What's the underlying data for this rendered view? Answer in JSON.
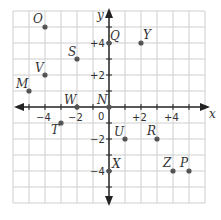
{
  "plane": {
    "x_axis_label": "x",
    "y_axis_label": "y",
    "origin_label": "0",
    "range": {
      "xmin": -6,
      "xmax": 6,
      "ymin": -6,
      "ymax": 6
    },
    "x_ticks": [
      {
        "value": -4,
        "label": "−4"
      },
      {
        "value": -2,
        "label": "−2"
      },
      {
        "value": 2,
        "label": "+2"
      },
      {
        "value": 4,
        "label": "+4"
      }
    ],
    "y_ticks": [
      {
        "value": 4,
        "label": "+4"
      },
      {
        "value": 2,
        "label": "+2"
      },
      {
        "value": -2,
        "label": "−2"
      },
      {
        "value": -4,
        "label": "−4"
      }
    ],
    "colors": {
      "grid": "#cfcfcf",
      "axis": "#222222",
      "point": "#555555"
    }
  },
  "points": [
    {
      "name": "O",
      "x": -4,
      "y": 5
    },
    {
      "name": "Q",
      "x": 0,
      "y": 4
    },
    {
      "name": "Y",
      "x": 2,
      "y": 4
    },
    {
      "name": "S",
      "x": -2,
      "y": 3
    },
    {
      "name": "V",
      "x": -4,
      "y": 2
    },
    {
      "name": "M",
      "x": -5,
      "y": 1
    },
    {
      "name": "W",
      "x": -2,
      "y": 0
    },
    {
      "name": "N",
      "x": 0,
      "y": 0
    },
    {
      "name": "T",
      "x": -3,
      "y": -1
    },
    {
      "name": "U",
      "x": 1,
      "y": -2
    },
    {
      "name": "R",
      "x": 3,
      "y": -2
    },
    {
      "name": "X",
      "x": 0,
      "y": -4
    },
    {
      "name": "Z",
      "x": 4,
      "y": -4
    },
    {
      "name": "P",
      "x": 5,
      "y": -4
    }
  ]
}
